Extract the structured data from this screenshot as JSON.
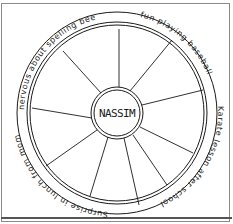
{
  "diagram": {
    "type": "emotion-wheel",
    "center_label": "NASSIM",
    "spokes": 10,
    "rim_labels": [
      {
        "text": "nervous about spelling bee",
        "position": "upper-left"
      },
      {
        "text": "fun playing baseball",
        "position": "upper-right"
      },
      {
        "text": "Karate lesson after school",
        "position": "right"
      },
      {
        "text": "Surprise in lunch from mom",
        "position": "lower-left"
      }
    ],
    "colors": {
      "ink": "#1a1a1a",
      "frame": "#8a8a8a",
      "background": "#ffffff"
    }
  }
}
